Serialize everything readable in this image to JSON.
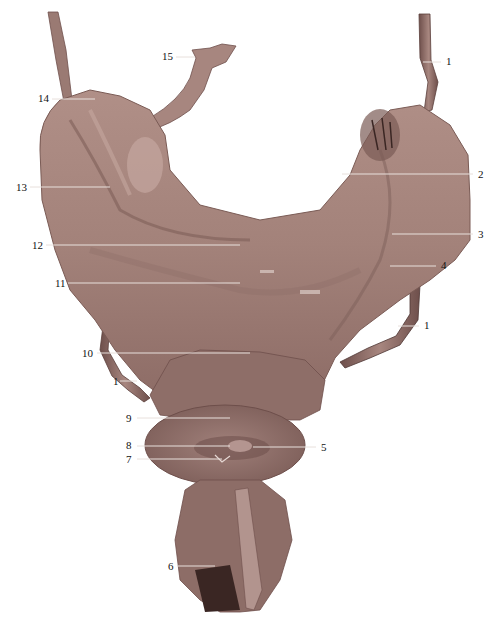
{
  "figure": {
    "type": "anatomical-specimen-photo",
    "background": "#ffffff",
    "tissue_colors": {
      "base": "#a7867f",
      "dark": "#6e4f4b",
      "light": "#c4a69f",
      "deep": "#3a2623"
    },
    "labels": [
      {
        "id": "1a",
        "text": "1",
        "x": 446,
        "y": 62,
        "lx1": 423,
        "ly1": 62,
        "lx2": 441,
        "ly2": 62
      },
      {
        "id": "2",
        "text": "2",
        "x": 478,
        "y": 175,
        "lx1": 342,
        "ly1": 174,
        "lx2": 473,
        "ly2": 174
      },
      {
        "id": "3",
        "text": "3",
        "x": 478,
        "y": 235,
        "lx1": 392,
        "ly1": 234,
        "lx2": 473,
        "ly2": 234
      },
      {
        "id": "4",
        "text": "4",
        "x": 441,
        "y": 266,
        "lx1": 390,
        "ly1": 266,
        "lx2": 436,
        "ly2": 266
      },
      {
        "id": "1b",
        "text": "1",
        "x": 424,
        "y": 326,
        "lx1": 398,
        "ly1": 326,
        "lx2": 419,
        "ly2": 326
      },
      {
        "id": "5",
        "text": "5",
        "x": 321,
        "y": 448,
        "lx1": 253,
        "ly1": 447,
        "lx2": 316,
        "ly2": 447
      },
      {
        "id": "6",
        "text": "6",
        "x": 168,
        "y": 567,
        "lx1": 178,
        "ly1": 566,
        "lx2": 215,
        "ly2": 566
      },
      {
        "id": "7",
        "text": "7",
        "x": 126,
        "y": 460,
        "lx1": 137,
        "ly1": 459,
        "lx2": 222,
        "ly2": 459
      },
      {
        "id": "8",
        "text": "8",
        "x": 126,
        "y": 446,
        "lx1": 137,
        "ly1": 446,
        "lx2": 230,
        "ly2": 446
      },
      {
        "id": "9",
        "text": "9",
        "x": 126,
        "y": 419,
        "lx1": 137,
        "ly1": 418,
        "lx2": 230,
        "ly2": 418
      },
      {
        "id": "10",
        "text": "10",
        "x": 82,
        "y": 354,
        "lx1": 97,
        "ly1": 353,
        "lx2": 250,
        "ly2": 353
      },
      {
        "id": "1c",
        "text": "1",
        "x": 113,
        "y": 382,
        "lx1": 120,
        "ly1": 381,
        "lx2": 137,
        "ly2": 381
      },
      {
        "id": "11",
        "text": "11",
        "x": 55,
        "y": 284,
        "lx1": 68,
        "ly1": 283,
        "lx2": 240,
        "ly2": 283
      },
      {
        "id": "12",
        "text": "12",
        "x": 32,
        "y": 246,
        "lx1": 46,
        "ly1": 245,
        "lx2": 240,
        "ly2": 245
      },
      {
        "id": "13",
        "text": "13",
        "x": 16,
        "y": 188,
        "lx1": 30,
        "ly1": 187,
        "lx2": 110,
        "ly2": 187
      },
      {
        "id": "14",
        "text": "14",
        "x": 38,
        "y": 99,
        "lx1": 52,
        "ly1": 99,
        "lx2": 95,
        "ly2": 99
      },
      {
        "id": "15",
        "text": "15",
        "x": 162,
        "y": 57,
        "lx1": 176,
        "ly1": 57,
        "lx2": 195,
        "ly2": 57
      }
    ]
  }
}
